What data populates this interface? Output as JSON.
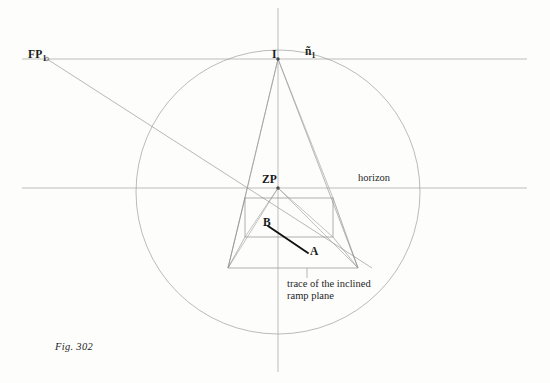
{
  "figure": {
    "caption": "Fig. 302",
    "labels": {
      "fp1_main": "FP",
      "fp1_sub": "1",
      "i": "I",
      "n1_main": "ñ",
      "n1_sub": "1",
      "zp": "ZP",
      "horizon": "horizon",
      "b": "B",
      "a": "A"
    },
    "annotation": {
      "line1": "trace of the inclined",
      "line2": "ramp plane"
    },
    "colors": {
      "background": "#fdfdfc",
      "construction_line": "#9a9a9a",
      "circle_line": "#9a9a9a",
      "solid_edge": "#8a8a8a",
      "trace_line": "#111111",
      "text": "#1a1a1a"
    },
    "geometry": {
      "circle": {
        "cx": 278,
        "cy": 192,
        "r": 142
      },
      "vertical_axis": {
        "x": 278,
        "y_top": 8,
        "y_bottom": 372
      },
      "upper_horizontal": {
        "y": 59,
        "x_start": 22,
        "x_end": 527
      },
      "horizon_line": {
        "y": 188,
        "x_start": 22,
        "x_end": 527
      },
      "point_fp1": {
        "x": 47,
        "y": 59
      },
      "point_i": {
        "x": 278,
        "y": 59
      },
      "point_zp": {
        "x": 278,
        "y": 188
      },
      "point_b": {
        "x": 270,
        "y": 228
      },
      "point_a": {
        "x": 305,
        "y": 253
      },
      "rectangle": {
        "x1": 245,
        "y1": 198,
        "x2": 333,
        "y2": 237
      },
      "trapezoid": {
        "left_base": 228,
        "right_base": 358,
        "base_y": 268
      }
    }
  }
}
